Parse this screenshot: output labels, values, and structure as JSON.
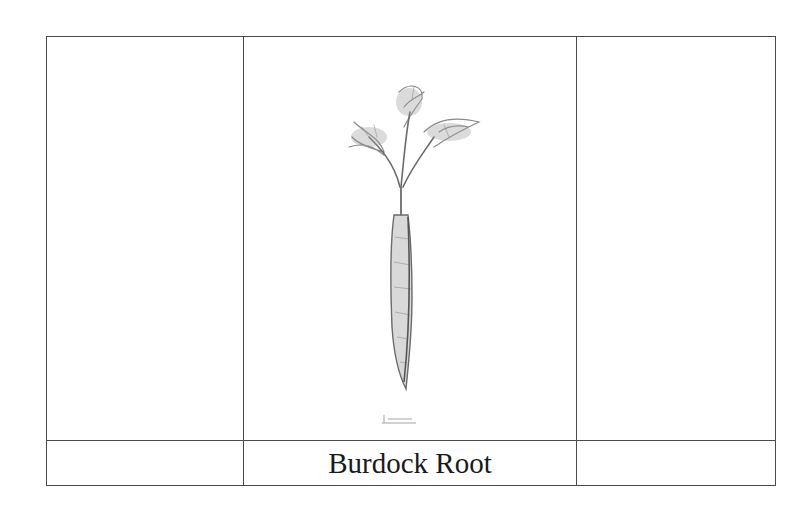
{
  "document": {
    "table": {
      "rows": [
        {
          "cells": [
            {
              "content": ""
            },
            {
              "content": "image",
              "image_semantic": "burdock-root-illustration"
            },
            {
              "content": ""
            }
          ]
        },
        {
          "cells": [
            {
              "content": ""
            },
            {
              "content": "Burdock Root"
            },
            {
              "content": ""
            }
          ]
        }
      ]
    },
    "colors": {
      "border": "#4a4a4a",
      "text": "#1a1a1a",
      "sketch": "#6b6b6b"
    }
  }
}
